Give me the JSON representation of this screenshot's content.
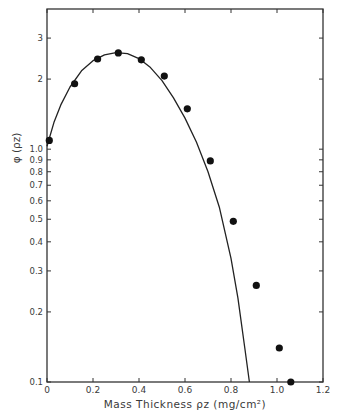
{
  "chart_data": {
    "type": "scatter",
    "title": "",
    "xlabel": "Mass  Thickness  ρz  (mg/cm²)",
    "ylabel": "φ  (ρz)",
    "x_scale": "linear",
    "y_scale": "log",
    "xlim": [
      0,
      1.2
    ],
    "ylim": [
      0.1,
      4.0
    ],
    "grid": false,
    "legend": null,
    "x_ticks": [
      0,
      0.2,
      0.4,
      0.6,
      0.8,
      1.0,
      1.2
    ],
    "x_tick_labels": [
      "0",
      "0.2",
      "0.4",
      "0.6",
      "0.8",
      "1.0",
      "1.2"
    ],
    "y_ticks": [
      0.1,
      0.2,
      0.3,
      0.4,
      0.5,
      0.6,
      0.7,
      0.8,
      0.9,
      1.0,
      2,
      3
    ],
    "y_tick_labels": [
      "0.1",
      "0.2",
      "0.3",
      "0.4",
      "0.5",
      "0.6",
      "0.7",
      "0.8",
      "0.9",
      "1.0",
      "2",
      "3"
    ],
    "series": [
      {
        "name": "measured",
        "kind": "points",
        "marker": "filled-circle",
        "x": [
          0.01,
          0.12,
          0.22,
          0.31,
          0.41,
          0.51,
          0.61,
          0.71,
          0.81,
          0.91,
          1.01,
          1.06
        ],
        "y": [
          1.09,
          1.91,
          2.44,
          2.59,
          2.42,
          2.06,
          1.49,
          0.89,
          0.49,
          0.26,
          0.14,
          0.1
        ]
      },
      {
        "name": "calculated",
        "kind": "curve",
        "x": [
          0.0,
          0.03,
          0.06,
          0.1,
          0.15,
          0.2,
          0.25,
          0.3,
          0.35,
          0.4,
          0.45,
          0.5,
          0.55,
          0.6,
          0.65,
          0.7,
          0.75,
          0.8,
          0.83,
          0.86,
          0.88
        ],
        "y": [
          1.03,
          1.3,
          1.55,
          1.85,
          2.17,
          2.4,
          2.54,
          2.6,
          2.57,
          2.45,
          2.24,
          1.97,
          1.66,
          1.36,
          1.07,
          0.8,
          0.56,
          0.34,
          0.23,
          0.14,
          0.1
        ]
      }
    ]
  }
}
